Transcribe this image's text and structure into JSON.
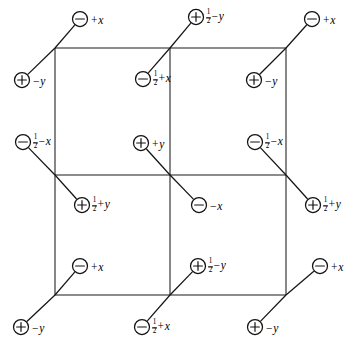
{
  "figure": {
    "kind": "space-group-symmetry-diagram",
    "background_color": "#ffffff",
    "line_color": "#1a1a1a",
    "text_color": "#000000"
  },
  "grid": {
    "columns": 2,
    "rows": 2,
    "x_lines": [
      55,
      170,
      286
    ],
    "y_lines": [
      48,
      175,
      295
    ],
    "label": "unit cell grid"
  },
  "sites": [
    {
      "id": "site-top-left-upper",
      "charge": "minus",
      "charge_glyph": "⊖",
      "sign": "+",
      "fraction": "",
      "variable": "x",
      "text": "+ x",
      "label_anchor": "left",
      "circle": {
        "cx": 80,
        "cy": 19,
        "r": 7.5
      },
      "label": {
        "x": 91,
        "y": 19
      },
      "tie_to": {
        "x": 55,
        "y": 48
      }
    },
    {
      "id": "site-top-left-lower",
      "charge": "plus",
      "charge_glyph": "⊕",
      "sign": "−",
      "fraction": "",
      "variable": "y",
      "text": "− y",
      "label_anchor": "left",
      "circle": {
        "cx": 22,
        "cy": 80,
        "r": 7.5
      },
      "label": {
        "x": 33,
        "y": 80
      },
      "tie_to": {
        "x": 55,
        "y": 48
      }
    },
    {
      "id": "site-top-mid-upper",
      "charge": "plus",
      "charge_glyph": "⊕",
      "sign": "−",
      "fraction": "1/2",
      "variable": "y",
      "text": "½ − y",
      "label_anchor": "left",
      "circle": {
        "cx": 196,
        "cy": 17,
        "r": 7.5
      },
      "label": {
        "x": 206,
        "y": 17
      },
      "tie_to": {
        "x": 170,
        "y": 48
      }
    },
    {
      "id": "site-top-mid-lower",
      "charge": "minus",
      "charge_glyph": "⊖",
      "sign": "+",
      "fraction": "1/2",
      "variable": "x",
      "text": "½ + x",
      "label_anchor": "left",
      "circle": {
        "cx": 143,
        "cy": 79,
        "r": 7.5
      },
      "label": {
        "x": 153,
        "y": 79
      },
      "tie_to": {
        "x": 170,
        "y": 48
      }
    },
    {
      "id": "site-top-right-upper",
      "charge": "minus",
      "charge_glyph": "⊖",
      "sign": "+",
      "fraction": "",
      "variable": "x",
      "text": "+ x",
      "label_anchor": "left",
      "circle": {
        "cx": 312,
        "cy": 19,
        "r": 7.5
      },
      "label": {
        "x": 323,
        "y": 19
      },
      "tie_to": {
        "x": 286,
        "y": 48
      }
    },
    {
      "id": "site-top-right-lower",
      "charge": "plus",
      "charge_glyph": "⊕",
      "sign": "−",
      "fraction": "",
      "variable": "y",
      "text": "− y",
      "label_anchor": "left",
      "circle": {
        "cx": 254,
        "cy": 80,
        "r": 7.5
      },
      "label": {
        "x": 265,
        "y": 80
      },
      "tie_to": {
        "x": 286,
        "y": 48
      }
    },
    {
      "id": "site-mid-left-upper",
      "charge": "minus",
      "charge_glyph": "⊖",
      "sign": "−",
      "fraction": "1/2",
      "variable": "x",
      "text": "½ − x",
      "label_anchor": "left",
      "circle": {
        "cx": 23,
        "cy": 142,
        "r": 7.5
      },
      "label": {
        "x": 33,
        "y": 142
      },
      "tie_to": {
        "x": 55,
        "y": 175
      }
    },
    {
      "id": "site-mid-left-lower",
      "charge": "plus",
      "charge_glyph": "⊕",
      "sign": "+",
      "fraction": "1/2",
      "variable": "y",
      "text": "½ + y",
      "label_anchor": "left",
      "circle": {
        "cx": 82,
        "cy": 205,
        "r": 7.5
      },
      "label": {
        "x": 92,
        "y": 205
      },
      "tie_to": {
        "x": 55,
        "y": 175
      }
    },
    {
      "id": "site-center-upper",
      "charge": "plus",
      "charge_glyph": "⊕",
      "sign": "+",
      "fraction": "",
      "variable": "y",
      "text": "+ y",
      "label_anchor": "left",
      "circle": {
        "cx": 141,
        "cy": 143,
        "r": 7.5
      },
      "label": {
        "x": 152,
        "y": 143
      },
      "tie_to": {
        "x": 170,
        "y": 175
      }
    },
    {
      "id": "site-center-lower",
      "charge": "minus",
      "charge_glyph": "⊖",
      "sign": "−",
      "fraction": "",
      "variable": "x",
      "text": "− x",
      "label_anchor": "left",
      "circle": {
        "cx": 199,
        "cy": 205,
        "r": 7.5
      },
      "label": {
        "x": 210,
        "y": 205
      },
      "tie_to": {
        "x": 170,
        "y": 175
      }
    },
    {
      "id": "site-mid-right-upper",
      "charge": "minus",
      "charge_glyph": "⊖",
      "sign": "−",
      "fraction": "1/2",
      "variable": "x",
      "text": "½ − x",
      "label_anchor": "left",
      "circle": {
        "cx": 255,
        "cy": 142,
        "r": 7.5
      },
      "label": {
        "x": 265,
        "y": 142
      },
      "tie_to": {
        "x": 286,
        "y": 175
      }
    },
    {
      "id": "site-mid-right-lower",
      "charge": "plus",
      "charge_glyph": "⊕",
      "sign": "+",
      "fraction": "1/2",
      "variable": "y",
      "text": "½ + y",
      "label_anchor": "left",
      "circle": {
        "cx": 313,
        "cy": 205,
        "r": 7.5
      },
      "label": {
        "x": 323,
        "y": 205
      },
      "tie_to": {
        "x": 286,
        "y": 175
      }
    },
    {
      "id": "site-bot-left-upper",
      "charge": "minus",
      "charge_glyph": "⊖",
      "sign": "+",
      "fraction": "",
      "variable": "x",
      "text": "+ x",
      "label_anchor": "left",
      "circle": {
        "cx": 80,
        "cy": 266,
        "r": 7.5
      },
      "label": {
        "x": 91,
        "y": 266
      },
      "tie_to": {
        "x": 55,
        "y": 295
      }
    },
    {
      "id": "site-bot-left-lower",
      "charge": "plus",
      "charge_glyph": "⊕",
      "sign": "−",
      "fraction": "",
      "variable": "y",
      "text": "− y",
      "label_anchor": "left",
      "circle": {
        "cx": 21,
        "cy": 327,
        "r": 7.5
      },
      "label": {
        "x": 32,
        "y": 327
      },
      "tie_to": {
        "x": 55,
        "y": 295
      }
    },
    {
      "id": "site-bot-mid-upper",
      "charge": "plus",
      "charge_glyph": "⊕",
      "sign": "−",
      "fraction": "1/2",
      "variable": "y",
      "text": "½ − y",
      "label_anchor": "left",
      "circle": {
        "cx": 198,
        "cy": 266,
        "r": 7.5
      },
      "label": {
        "x": 208,
        "y": 266
      },
      "tie_to": {
        "x": 170,
        "y": 295
      }
    },
    {
      "id": "site-bot-mid-lower",
      "charge": "minus",
      "charge_glyph": "⊖",
      "sign": "+",
      "fraction": "1/2",
      "variable": "x",
      "text": "½ + x",
      "label_anchor": "left",
      "circle": {
        "cx": 142,
        "cy": 327,
        "r": 7.5
      },
      "label": {
        "x": 152,
        "y": 327
      },
      "tie_to": {
        "x": 170,
        "y": 295
      }
    },
    {
      "id": "site-bot-right-upper",
      "charge": "minus",
      "charge_glyph": "⊖",
      "sign": "+",
      "fraction": "",
      "variable": "x",
      "text": "+ x",
      "label_anchor": "left",
      "circle": {
        "cx": 320,
        "cy": 266,
        "r": 7.5
      },
      "label": {
        "x": 331,
        "y": 266
      },
      "tie_to": {
        "x": 286,
        "y": 295
      }
    },
    {
      "id": "site-bot-right-lower",
      "charge": "plus",
      "charge_glyph": "⊕",
      "sign": "−",
      "fraction": "",
      "variable": "y",
      "text": "− y",
      "label_anchor": "left",
      "circle": {
        "cx": 255,
        "cy": 327,
        "r": 7.5
      },
      "label": {
        "x": 266,
        "y": 327
      },
      "tie_to": {
        "x": 286,
        "y": 295
      }
    }
  ]
}
